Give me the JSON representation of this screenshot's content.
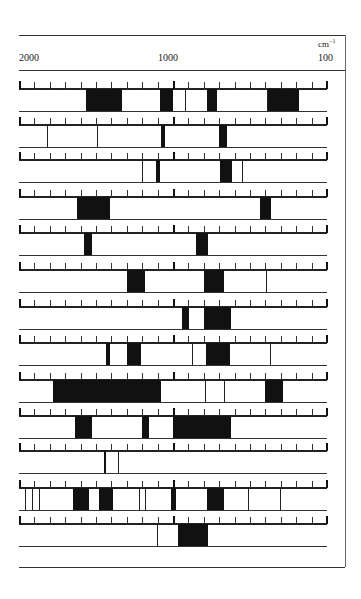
{
  "header": {
    "unit_label": "cm",
    "unit_exp": "−1",
    "axis_ticks": [
      "2000",
      "1000",
      "100"
    ]
  },
  "chart_data": {
    "type": "table",
    "title": "",
    "xlabel": "cm⁻¹",
    "x_axis": {
      "left": 2000,
      "middle": 1000,
      "right": 100,
      "grid": false
    },
    "note": "Band positions given as pixel offsets (0-308) along the scale; 0=2000, 154=1000, 308=100 cm⁻¹",
    "rows": [
      {
        "bands": [
          [
            67,
            103
          ],
          [
            141,
            154
          ],
          [
            188,
            198
          ],
          [
            248,
            280
          ]
        ],
        "lines": [
          166,
          248
        ]
      },
      {
        "bands": [
          [
            142,
            146
          ],
          [
            200,
            208
          ]
        ],
        "lines": [
          28,
          78
        ]
      },
      {
        "bands": [
          [
            137,
            141
          ],
          [
            201,
            213
          ]
        ],
        "lines": [
          123,
          223
        ]
      },
      {
        "bands": [
          [
            58,
            91
          ],
          [
            241,
            252
          ]
        ],
        "lines": []
      },
      {
        "bands": [
          [
            65,
            73
          ],
          [
            177,
            189
          ]
        ],
        "lines": []
      },
      {
        "bands": [
          [
            108,
            126
          ],
          [
            185,
            205
          ]
        ],
        "lines": [
          247
        ]
      },
      {
        "bands": [
          [
            163,
            170
          ],
          [
            185,
            212
          ]
        ],
        "lines": []
      },
      {
        "bands": [
          [
            87,
            91
          ],
          [
            108,
            122
          ],
          [
            187,
            211
          ]
        ],
        "lines": [
          173,
          251
        ]
      },
      {
        "bands": [
          [
            34,
            142
          ],
          [
            246,
            264
          ]
        ],
        "lines": [
          186,
          205
        ]
      },
      {
        "bands": [
          [
            56,
            73
          ],
          [
            123,
            130
          ],
          [
            154,
            212
          ]
        ],
        "lines": []
      },
      {
        "bands": [
          [
            85,
            87
          ]
        ],
        "lines": [
          99
        ]
      },
      {
        "bands": [
          [
            54,
            70
          ],
          [
            80,
            94
          ],
          [
            152,
            157
          ],
          [
            188,
            205
          ]
        ],
        "lines": [
          6,
          13,
          20,
          120,
          126,
          229,
          261
        ]
      },
      {
        "bands": [
          [
            159,
            189
          ]
        ],
        "lines": [
          138
        ]
      }
    ]
  }
}
